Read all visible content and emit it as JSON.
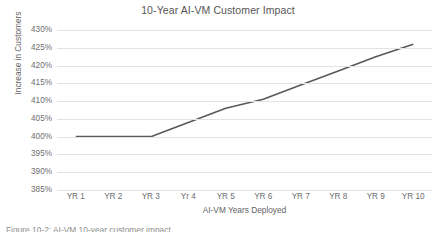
{
  "chart_data": {
    "type": "line",
    "title": "10-Year AI-VM Customer Impact",
    "xlabel": "AI-VM Years Deployed",
    "ylabel": "Increase in Customers",
    "categories": [
      "YR 1",
      "YR 2",
      "YR 3",
      "Yr 4",
      "YR 5",
      "YR 6",
      "YR 7",
      "YR 8",
      "YR 9",
      "YR 10"
    ],
    "values": [
      400,
      400,
      400,
      404,
      408,
      410.5,
      414.5,
      418.5,
      422.5,
      426
    ],
    "value_labels": [
      "400%",
      "400%",
      "400%",
      "404%",
      "408%",
      "410.5%",
      "414.5%",
      "418.5%",
      "422.5%",
      "426%"
    ],
    "ylim": [
      385,
      430
    ],
    "yticks": [
      385,
      390,
      395,
      400,
      405,
      410,
      415,
      420,
      425,
      430
    ],
    "ytick_labels": [
      "385%",
      "390%",
      "395%",
      "400%",
      "405%",
      "410%",
      "415%",
      "420%",
      "425%",
      "430%"
    ],
    "grid": true,
    "legend": false,
    "series_color": "#595959",
    "gridline_color": "#e3e3e3",
    "text_color": "#6e6e6e",
    "title_color": "#565656",
    "background_color": "#ffffff"
  },
  "caption": {
    "text": "Figure 10-2: AI-VM 10-year customer impact"
  }
}
